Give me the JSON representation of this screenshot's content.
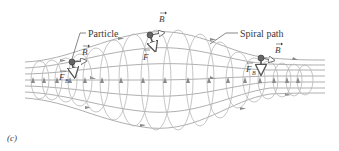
{
  "figure": {
    "panel_label": "(c)",
    "labels": {
      "particle": "Particle",
      "spiral_path": "Spiral path"
    },
    "vectors": {
      "B_left": "B",
      "B_mid": "B",
      "B_right": "B",
      "F_left": "F",
      "F_left_sub": "B",
      "F_mid": "F",
      "F_right": "F",
      "F_right_sub": "B"
    },
    "colors": {
      "field_line": "#9a9a9a",
      "loop_line": "#b8b8b8",
      "arrow_fill": "#8a8a8a",
      "vector": "#555555",
      "text": "#3a3a3a"
    }
  }
}
